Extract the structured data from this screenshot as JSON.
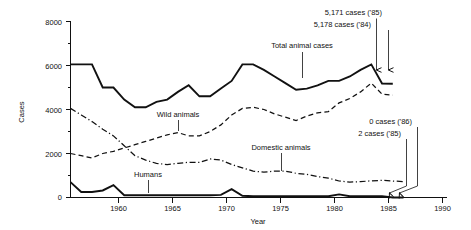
{
  "chart_data": {
    "type": "line",
    "title": "",
    "xlabel": "Year",
    "ylabel": "Cases",
    "xlim": [
      1955,
      1990
    ],
    "ylim": [
      0,
      8000
    ],
    "grid": false,
    "legend_position": "inline-labels",
    "xticks": [
      "1960",
      "1965",
      "1970",
      "1975",
      "1980",
      "1985",
      "1990"
    ],
    "xtick_values": [
      1960,
      1965,
      1970,
      1975,
      1980,
      1985,
      1990
    ],
    "yticks": [
      "0",
      "2000",
      "4000",
      "6000",
      "8000"
    ],
    "ytick_values": [
      0,
      2000,
      4000,
      6000,
      8000
    ],
    "minor_yticks": [
      1000,
      3000,
      5000,
      7000
    ],
    "series": [
      {
        "name": "Total animal cases",
        "style": "solid-thick",
        "x": [
          1955,
          1956,
          1957,
          1958,
          1959,
          1960,
          1961,
          1962,
          1963,
          1964,
          1965,
          1966,
          1967,
          1968,
          1969,
          1970,
          1971,
          1972,
          1973,
          1974,
          1975,
          1976,
          1977,
          1978,
          1979,
          1980,
          1981,
          1982,
          1983,
          1984,
          1985
        ],
        "values": [
          6050,
          6050,
          6050,
          5000,
          5000,
          4450,
          4100,
          4100,
          4350,
          4450,
          4800,
          5100,
          4600,
          4600,
          4950,
          5300,
          6050,
          6050,
          5800,
          5500,
          5200,
          4900,
          4950,
          5100,
          5300,
          5300,
          5500,
          5800,
          6050,
          5178,
          5171
        ]
      },
      {
        "name": "Wild animals",
        "style": "dashed",
        "x": [
          1955,
          1956,
          1957,
          1958,
          1959,
          1960,
          1961,
          1962,
          1963,
          1964,
          1965,
          1966,
          1967,
          1968,
          1969,
          1970,
          1971,
          1972,
          1973,
          1974,
          1975,
          1976,
          1977,
          1978,
          1979,
          1980,
          1981,
          1982,
          1983,
          1984,
          1985
        ],
        "values": [
          2000,
          1900,
          1800,
          2000,
          2100,
          2250,
          2400,
          2550,
          2700,
          2850,
          2950,
          2800,
          2800,
          3000,
          3300,
          3750,
          4050,
          4100,
          4000,
          3800,
          3650,
          3500,
          3700,
          3850,
          3900,
          4300,
          4500,
          4800,
          5200,
          4700,
          4650
        ]
      },
      {
        "name": "Domestic animals",
        "style": "dash-dot",
        "x": [
          1955,
          1956,
          1957,
          1958,
          1959,
          1960,
          1961,
          1962,
          1963,
          1964,
          1965,
          1966,
          1967,
          1968,
          1969,
          1970,
          1971,
          1972,
          1973,
          1974,
          1975,
          1976,
          1977,
          1978,
          1979,
          1980,
          1981,
          1982,
          1983,
          1984,
          1985,
          1986
        ],
        "values": [
          4050,
          3750,
          3450,
          3100,
          2800,
          2350,
          1900,
          1700,
          1550,
          1500,
          1550,
          1600,
          1600,
          1750,
          1700,
          1500,
          1350,
          1200,
          1150,
          1200,
          1200,
          1100,
          1050,
          950,
          880,
          750,
          700,
          720,
          760,
          780,
          750,
          720
        ]
      },
      {
        "name": "Humans",
        "style": "solid-thick",
        "x": [
          1955,
          1956,
          1957,
          1958,
          1959,
          1960,
          1961,
          1962,
          1963,
          1964,
          1965,
          1966,
          1967,
          1968,
          1969,
          1970,
          1971,
          1972,
          1973,
          1974,
          1975,
          1976,
          1977,
          1978,
          1979,
          1980,
          1981,
          1982,
          1983,
          1984,
          1985,
          1986
        ],
        "values": [
          700,
          250,
          250,
          320,
          560,
          100,
          100,
          100,
          100,
          100,
          100,
          100,
          100,
          100,
          120,
          380,
          80,
          60,
          60,
          60,
          60,
          60,
          60,
          60,
          60,
          140,
          60,
          60,
          60,
          60,
          2,
          0
        ]
      }
    ],
    "annotations": [
      {
        "text": "5,171 cases ('85)",
        "x": 1985,
        "y": 5171
      },
      {
        "text": "5,178 cases ('84)",
        "x": 1984,
        "y": 5178
      },
      {
        "text": "0 cases ('86)",
        "x": 1986,
        "y": 0
      },
      {
        "text": "2 cases ('85)",
        "x": 1985,
        "y": 2
      }
    ],
    "inline_labels": [
      {
        "text": "Total animal cases",
        "x": 1977,
        "y": 5000
      },
      {
        "text": "Wild animals",
        "x": 1966,
        "y": 2800
      },
      {
        "text": "Domestic animals",
        "x": 1975,
        "y": 1200
      },
      {
        "text": "Humans",
        "x": 1963,
        "y": 100
      }
    ]
  },
  "axis": {
    "y_title": "Cases",
    "x_title": "Year",
    "yticks": {
      "t0": "0",
      "t2000": "2000",
      "t4000": "4000",
      "t6000": "6000",
      "t8000": "8000"
    },
    "xticks": {
      "t1960": "1960",
      "t1965": "1965",
      "t1970": "1970",
      "t1975": "1975",
      "t1980": "1980",
      "t1985": "1985",
      "t1990": "1990"
    }
  },
  "labels": {
    "total": "Total animal cases",
    "wild": "Wild animals",
    "domestic": "Domestic animals",
    "humans": "Humans"
  },
  "annotations": {
    "top_right_1": "5,171 cases ('85)",
    "top_right_2": "5,178 cases ('84)",
    "bottom_right_1": "0 cases ('86)",
    "bottom_right_2": "2 cases ('85)"
  },
  "colors": {
    "ink": "#111111",
    "background": "#ffffff"
  }
}
